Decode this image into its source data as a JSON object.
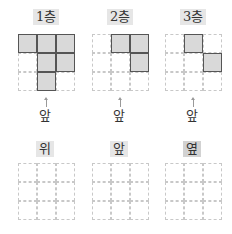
{
  "top_views": [
    {
      "label": "1층",
      "highlight": true,
      "left": 18,
      "filled": [
        [
          0,
          0
        ],
        [
          0,
          1
        ],
        [
          0,
          2
        ],
        [
          1,
          1
        ],
        [
          1,
          2
        ],
        [
          2,
          1
        ]
      ],
      "front_label": "앞"
    },
    {
      "label": "2층",
      "highlight": true,
      "left": 92,
      "filled": [
        [
          0,
          1
        ],
        [
          0,
          2
        ],
        [
          1,
          2
        ]
      ],
      "front_label": "앞"
    },
    {
      "label": "3층",
      "highlight": true,
      "left": 165,
      "filled": [
        [
          0,
          1
        ],
        [
          1,
          2
        ]
      ],
      "front_label": "앞"
    }
  ],
  "bottom_views": [
    {
      "label": "위",
      "highlight": "light",
      "left": 18
    },
    {
      "label": "앞",
      "highlight": "light",
      "left": 92
    },
    {
      "label": "옆",
      "highlight": "dark",
      "left": 165
    }
  ],
  "colors": {
    "filled": "#d9d9d9",
    "border": "#555555",
    "grid_dashed": "#c8c8c8"
  }
}
